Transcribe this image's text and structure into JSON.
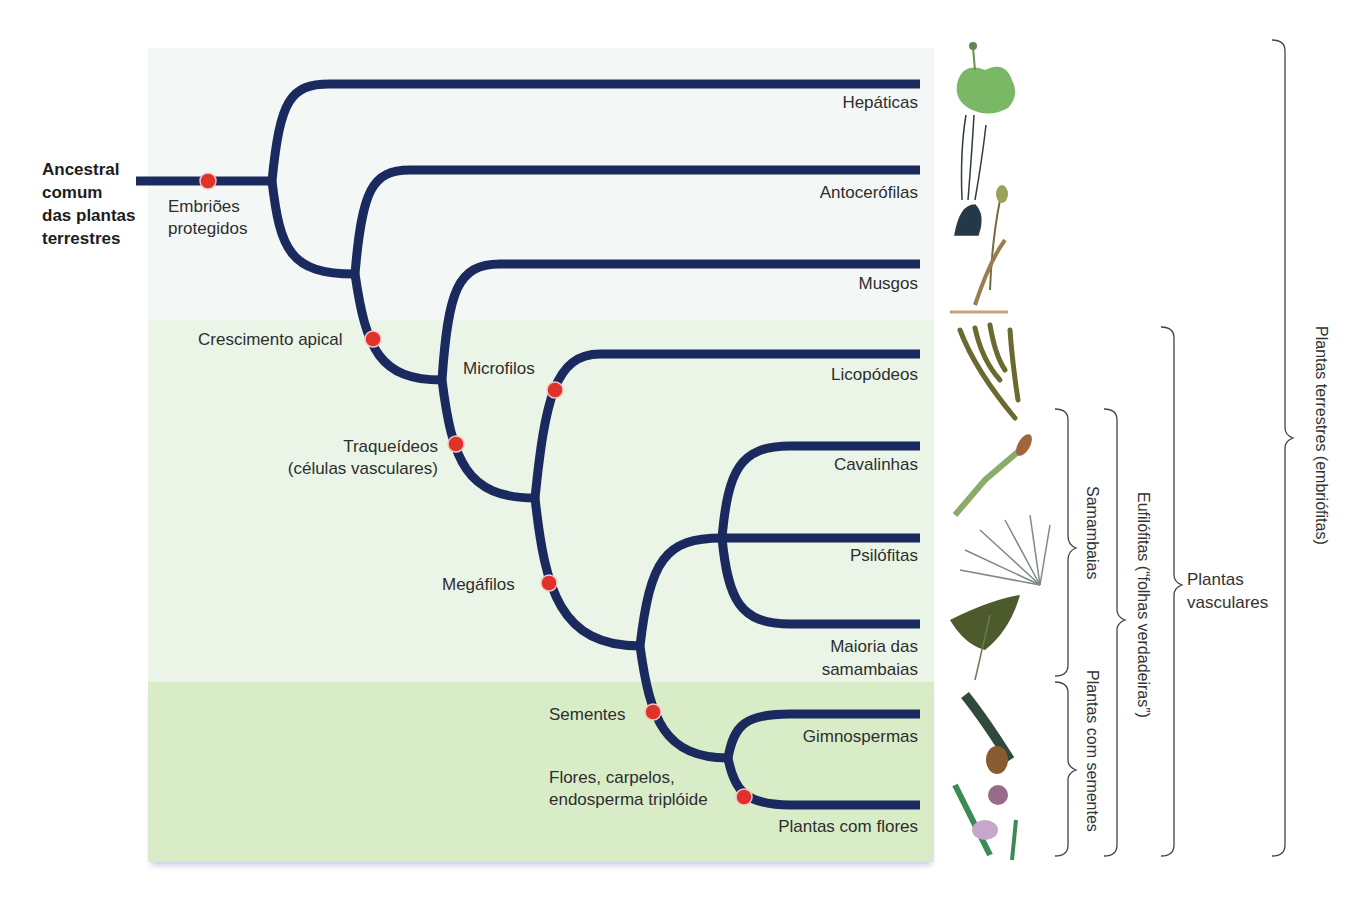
{
  "root": {
    "label_lines": [
      "Ancestral",
      "comum",
      "das plantas",
      "terrestres"
    ]
  },
  "taxa": [
    {
      "id": "hepaticas",
      "label": "Hepáticas"
    },
    {
      "id": "antocerofilas",
      "label": "Antocerófilas"
    },
    {
      "id": "musgos",
      "label": "Musgos"
    },
    {
      "id": "licopodeos",
      "label": "Licopódeos"
    },
    {
      "id": "cavalinhas",
      "label": "Cavalinhas"
    },
    {
      "id": "psilofitas",
      "label": "Psilófitas"
    },
    {
      "id": "samambaias",
      "label_lines": [
        "Maioria das",
        "samambaias"
      ]
    },
    {
      "id": "gimnospermas",
      "label": "Gimnospermas"
    },
    {
      "id": "angiospermas",
      "label": "Plantas com flores"
    }
  ],
  "traits": [
    {
      "id": "embrioes",
      "label_lines": [
        "Embriões",
        "protegidos"
      ]
    },
    {
      "id": "crescimento",
      "label": "Crescimento apical"
    },
    {
      "id": "microfilos",
      "label": "Microfilos"
    },
    {
      "id": "traqueideos",
      "label_lines": [
        "Traqueídeos",
        "(células vasculares)"
      ]
    },
    {
      "id": "megafilos",
      "label": "Megáfilos"
    },
    {
      "id": "sementes",
      "label": "Sementes"
    },
    {
      "id": "flores",
      "label_lines": [
        "Flores, carpelos,",
        "endosperma triplóide"
      ]
    }
  ],
  "brackets": [
    {
      "id": "samambaias",
      "label": "Samambaias"
    },
    {
      "id": "plantas-com-sementes",
      "label": "Plantas com sementes"
    },
    {
      "id": "eufilofitas",
      "label": "Eufilófitas (“folhas verdadeiras”)"
    },
    {
      "id": "plantas-vasculares",
      "label_lines": [
        "Plantas",
        "vasculares"
      ]
    },
    {
      "id": "plantas-terrestres",
      "label": "Plantas terrestres (embriófitas)"
    }
  ],
  "colors": {
    "branch": "#1b2a5e",
    "trait_marker": "#e0312b",
    "panel_top": "#f3f8f6",
    "panel_mid": "#eaf5e8",
    "panel_bottom": "#d8ecc8"
  }
}
